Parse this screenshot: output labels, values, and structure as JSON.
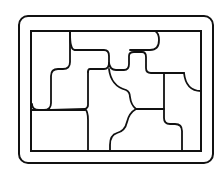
{
  "diagram": {
    "title": "Sliding block puzzle tray",
    "colors": {
      "stroke": "#111111",
      "background": "#ffffff"
    },
    "piece_count": 9,
    "pieces": [
      {
        "id": "piece-top-left"
      },
      {
        "id": "piece-top-bar"
      },
      {
        "id": "piece-top-right"
      },
      {
        "id": "piece-upper-middle"
      },
      {
        "id": "piece-center-cross"
      },
      {
        "id": "piece-right-column"
      },
      {
        "id": "piece-center-lower"
      },
      {
        "id": "piece-bottom-left"
      },
      {
        "id": "piece-bottom-right"
      }
    ]
  }
}
